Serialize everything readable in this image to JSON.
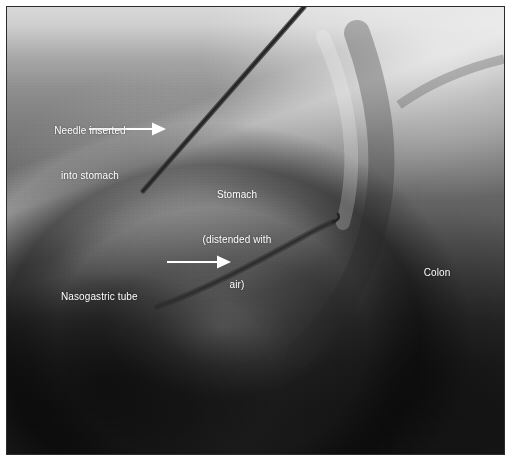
{
  "image": {
    "modality": "fluoroscopy",
    "description": "Grayscale abdominal fluoroscopic image showing a needle, a gas-distended stomach and a nasogastric tube"
  },
  "annotations": {
    "needle": {
      "name": "needle-label",
      "line1": "Needle inserted",
      "line2": "into stomach",
      "arrow": "arrow-right"
    },
    "stomach": {
      "name": "stomach-label",
      "line1": "Stomach",
      "line2": "(distended with",
      "line3": "air)"
    },
    "colon": {
      "name": "colon-label",
      "line1": "Colon"
    },
    "nasogastric": {
      "name": "nasogastric-tube-label",
      "line1": "Nasogastric tube",
      "arrow": "arrow-right"
    }
  },
  "colors": {
    "annotation_text": "#ffffff",
    "arrow": "#ffffff",
    "frame_border": "#2b2b2b",
    "page_background": "#ffffff",
    "needle": "#2f2f2f",
    "tube": "#3a3a3a"
  }
}
